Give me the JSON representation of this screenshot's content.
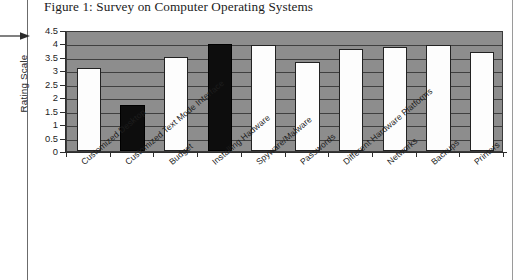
{
  "figure": {
    "title": "Figure 1: Survey on Computer Operating Systems"
  },
  "colors": {
    "plot_background": "#8d8d8d",
    "gridline": "#3f3f3f",
    "bar_white": "#fdfdfd",
    "bar_black": "#0d0d0d",
    "axis": "#2d2d2d",
    "text": "#1d1d1d"
  },
  "chart_data": {
    "type": "bar",
    "title": "Figure 1: Survey on Computer Operating Systems",
    "xlabel": "",
    "ylabel": "Rating Scale",
    "ylim": [
      0,
      4.5
    ],
    "ytick_labels": [
      "4.5",
      "4",
      "3.5",
      "3",
      "2.5",
      "2",
      "1.5",
      "1",
      "0.5",
      "0"
    ],
    "ytick_values": [
      4.5,
      4,
      3.5,
      3,
      2.5,
      2,
      1.5,
      1,
      0.5,
      0
    ],
    "grid": true,
    "legend": null,
    "categories": [
      "Customized Desktop",
      "Customized Text Mode Interface",
      "Budget",
      "Installing Hadware",
      "Spyware/Malware",
      "Passwords",
      "Different Hardware Platforms",
      "Networks",
      "Backups",
      "Printers"
    ],
    "values": [
      3.1,
      1.72,
      3.5,
      3.97,
      3.95,
      3.3,
      3.78,
      3.85,
      3.95,
      3.68
    ],
    "bar_colors": [
      "white",
      "black",
      "white",
      "black",
      "white",
      "white",
      "white",
      "white",
      "white",
      "white"
    ]
  },
  "margin_marker": {
    "icon": "arrow-right-icon"
  }
}
